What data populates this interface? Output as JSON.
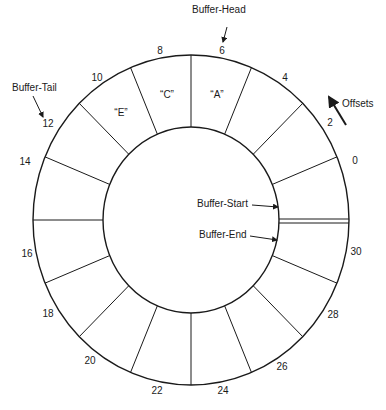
{
  "diagram": {
    "type": "circular-buffer",
    "segments": 16,
    "annotations": {
      "buffer_head": "Buffer-Head",
      "buffer_tail": "Buffer-Tail",
      "buffer_start": "Buffer-Start",
      "buffer_end": "Buffer-End",
      "offsets": "Offsets"
    },
    "cells": {
      "a": "“A”",
      "c": "“C”",
      "e": "“E”"
    },
    "offsets": [
      {
        "label": "0",
        "x": 355,
        "y": 160
      },
      {
        "label": "2",
        "x": 330,
        "y": 122
      },
      {
        "label": "4",
        "x": 285,
        "y": 77
      },
      {
        "label": "6",
        "x": 222,
        "y": 50
      },
      {
        "label": "8",
        "x": 160,
        "y": 50
      },
      {
        "label": "10",
        "x": 97,
        "y": 77
      },
      {
        "label": "12",
        "x": 48,
        "y": 123
      },
      {
        "label": "14",
        "x": 25,
        "y": 161
      },
      {
        "label": "16",
        "x": 27,
        "y": 253
      },
      {
        "label": "18",
        "x": 48,
        "y": 313
      },
      {
        "label": "20",
        "x": 90,
        "y": 360
      },
      {
        "label": "22",
        "x": 157,
        "y": 390
      },
      {
        "label": "24",
        "x": 223,
        "y": 390
      },
      {
        "label": "26",
        "x": 282,
        "y": 366
      },
      {
        "label": "28",
        "x": 333,
        "y": 314
      },
      {
        "label": "30",
        "x": 356,
        "y": 251
      }
    ],
    "line_color": "#1a1a1a"
  }
}
